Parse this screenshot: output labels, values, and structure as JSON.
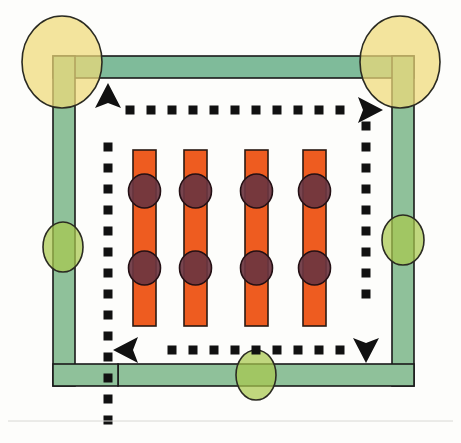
{
  "figure": {
    "title": "Schematic diagram: rectangular green conduit loop with flow path and sensor bars",
    "width": 461,
    "height": 443,
    "background_color": "#fdfdfb",
    "baseline_rule_color": "#d8d8d4"
  },
  "palette": {
    "band_green": "#8fc19a",
    "band_green_top": "#7fbb9a",
    "band_outline": "#1a1a1a",
    "ellipse_yellow": "#efd978",
    "ellipse_yellow_green": "#a7c84e",
    "ellipse_green_overlap": "#8cbb55",
    "bar_orange": "#ee5c20",
    "bar_outline": "#2a1a12",
    "node_maroon": "#6b3540",
    "node_outline": "#241014",
    "dash_black": "#111111"
  },
  "conduit": {
    "name": "green-conduit-loop",
    "band_thickness": 22,
    "segments": [
      {
        "id": "top-band",
        "label": "Top conduit band",
        "x": 53,
        "y": 56,
        "w": 361,
        "h": 22
      },
      {
        "id": "left-band",
        "label": "Left conduit band",
        "x": 53,
        "y": 56,
        "w": 22,
        "h": 330
      },
      {
        "id": "right-band",
        "label": "Right conduit band",
        "x": 392,
        "y": 56,
        "w": 22,
        "h": 330
      },
      {
        "id": "bottom-band",
        "label": "Bottom conduit band",
        "x": 118,
        "y": 364,
        "w": 296,
        "h": 22
      }
    ],
    "bottom_left_step": {
      "x": 53,
      "y": 364,
      "w": 65,
      "h": 22,
      "label": "Bottom-left step terminus"
    }
  },
  "ellipses": [
    {
      "id": "node-top-left",
      "label": "Top-left yellow node",
      "cx": 62,
      "cy": 62,
      "rx": 40,
      "ry": 46,
      "color": "#efd978"
    },
    {
      "id": "node-top-right",
      "label": "Top-right yellow node",
      "cx": 400,
      "cy": 62,
      "rx": 40,
      "ry": 46,
      "color": "#efd978"
    },
    {
      "id": "node-left-mid",
      "label": "Left-middle green node",
      "cx": 63,
      "cy": 247,
      "rx": 20,
      "ry": 25,
      "color": "#a7c84e"
    },
    {
      "id": "node-right-mid",
      "label": "Right-middle green node",
      "cx": 403,
      "cy": 240,
      "rx": 21,
      "ry": 25,
      "color": "#a7c84e"
    },
    {
      "id": "node-bottom-mid",
      "label": "Bottom-middle green node",
      "cx": 256,
      "cy": 375,
      "rx": 20,
      "ry": 25,
      "color": "#a7c84e"
    }
  ],
  "bars": {
    "label": "Orange vertical element bars",
    "count": 4,
    "width": 23,
    "top": 150,
    "bottom": 326,
    "x_positions": [
      133,
      184,
      245,
      303
    ],
    "node_rows": [
      191,
      268
    ],
    "node_rx": 16,
    "node_ry": 17
  },
  "flow_path": {
    "label": "Dashed flow path",
    "dash_size": 9,
    "dash_gap": 12,
    "segments": [
      {
        "id": "inlet-vertical",
        "label": "Inlet vertical dashed run",
        "orientation": "vertical",
        "x": 108,
        "y_from": 420,
        "y_to": 132
      },
      {
        "id": "top-horizontal",
        "label": "Top horizontal dashed run",
        "orientation": "horizontal",
        "y": 110,
        "x_from": 130,
        "x_to": 344
      },
      {
        "id": "right-vertical",
        "label": "Right descending dashed run",
        "orientation": "vertical",
        "x": 366,
        "y_from": 126,
        "y_to": 312
      },
      {
        "id": "bottom-horizontal",
        "label": "Bottom return dashed run",
        "orientation": "horizontal",
        "y": 350,
        "x_from": 340,
        "x_to": 158
      }
    ],
    "arrowheads": [
      {
        "id": "arrow-up",
        "label": "Upward flow arrow",
        "direction": "up",
        "x": 108,
        "y": 102
      },
      {
        "id": "arrow-right",
        "label": "Rightward flow arrow",
        "direction": "right",
        "x": 364,
        "y": 110
      },
      {
        "id": "arrow-down",
        "label": "Downward flow arrow",
        "direction": "down",
        "x": 366,
        "y": 344
      },
      {
        "id": "arrow-left",
        "label": "Leftward flow arrow",
        "direction": "left",
        "x": 132,
        "y": 350
      }
    ]
  }
}
